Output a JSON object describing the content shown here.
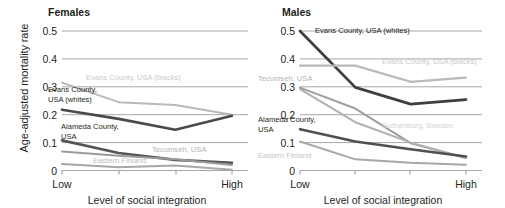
{
  "figure": {
    "ylabel": "Age-adjusted mortality rate",
    "xlabel": "Level of social integration",
    "xtick_low": "Low",
    "xtick_high": "High"
  },
  "panels": [
    {
      "id": "females",
      "title": "Females",
      "labels": [
        {
          "key": "evans_blacks",
          "text": "Evans County, USA (blacks)",
          "x": 86,
          "y": 80,
          "color": "#c9c9c9",
          "anchor": "start",
          "lines": [
            "Evans County, USA (blacks)"
          ]
        },
        {
          "key": "evans_whites",
          "text": "Evans County, USA (whites)",
          "x": 48,
          "y": 92,
          "color": "#231f20",
          "anchor": "start",
          "lines": [
            "Evans County,",
            "USA (whites)"
          ]
        },
        {
          "key": "alameda",
          "text": "Alameda County, USA",
          "x": 61,
          "y": 129,
          "color": "#231f20",
          "anchor": "start",
          "lines": [
            "Alameda County,",
            "USA"
          ]
        },
        {
          "key": "tecumseh",
          "text": "Tecumseh, USA",
          "x": 152,
          "y": 152,
          "color": "#b4b4b4",
          "anchor": "start",
          "lines": [
            "Tecumseh, USA"
          ]
        },
        {
          "key": "eastern_finland",
          "text": "Eastern Finland",
          "x": 93,
          "y": 163,
          "color": "#bdbdbd",
          "anchor": "start",
          "lines": [
            "Eastern Finland"
          ]
        }
      ]
    },
    {
      "id": "males",
      "title": "Males",
      "labels": [
        {
          "key": "evans_whites",
          "text": "Evans County, USA (whites)",
          "x": 315,
          "y": 33,
          "color": "#231f20",
          "anchor": "start",
          "lines": [
            "Evans County, USA (whites)"
          ]
        },
        {
          "key": "evans_blacks",
          "text": "Evans County, USA (blacks)",
          "x": 382,
          "y": 64,
          "color": "#c9c9c9",
          "anchor": "start",
          "lines": [
            "Evans County, USA (blacks)"
          ]
        },
        {
          "key": "tecumseh",
          "text": "Tecumseh, USA",
          "x": 258,
          "y": 81,
          "color": "#b4b4b4",
          "anchor": "start",
          "lines": [
            "Tecumseh, USA"
          ]
        },
        {
          "key": "alameda",
          "text": "Alameda County, USA",
          "x": 258,
          "y": 122,
          "color": "#231f20",
          "anchor": "start",
          "lines": [
            "Alameda County,",
            "USA"
          ]
        },
        {
          "key": "gothenburg",
          "text": "Gothenburg, Sweden",
          "x": 382,
          "y": 128,
          "color": "#d2d2d2",
          "anchor": "start",
          "lines": [
            "Gothenburg, Sweden"
          ]
        },
        {
          "key": "eastern_finland",
          "text": "Eastern Finland",
          "x": 258,
          "y": 158,
          "color": "#c4c4c4",
          "anchor": "start",
          "lines": [
            "Eastern Finland"
          ]
        }
      ]
    }
  ],
  "chart_data": [
    {
      "type": "line",
      "title": "Females",
      "xlabel": "Level of social integration",
      "ylabel": "Age-adjusted mortality rate",
      "x": [
        "Low",
        "2",
        "3",
        "High"
      ],
      "xtick_labels": [
        "Low",
        "",
        "",
        "High"
      ],
      "ylim": [
        0,
        0.5
      ],
      "yticks": [
        0,
        0.1,
        0.2,
        0.3,
        0.4,
        0.5
      ],
      "ytick_labels": [
        "0",
        "0.1",
        "0.2",
        "0.3",
        "0.4",
        "0.5"
      ],
      "grid": true,
      "legend": "inline-annotations",
      "series": [
        {
          "name": "Evans County, USA (blacks)",
          "color": "#b9b9b9",
          "width": 2.0,
          "values": [
            0.315,
            0.245,
            0.235,
            0.2
          ]
        },
        {
          "name": "Evans County, USA (whites)",
          "color": "#4a4a4a",
          "width": 2.6,
          "values": [
            0.218,
            0.185,
            0.146,
            0.196
          ]
        },
        {
          "name": "Alameda County, USA",
          "color": "#555555",
          "width": 2.6,
          "values": [
            0.108,
            0.063,
            0.038,
            0.028
          ]
        },
        {
          "name": "Tecumseh, USA",
          "color": "#9a9a9a",
          "width": 2.0,
          "values": [
            0.068,
            0.053,
            0.04,
            0.02
          ]
        },
        {
          "name": "Eastern Finland",
          "color": "#a8a8a8",
          "width": 2.0,
          "values": [
            0.023,
            0.012,
            0.018,
            0.003
          ]
        }
      ]
    },
    {
      "type": "line",
      "title": "Males",
      "xlabel": "Level of social integration",
      "ylabel": "Age-adjusted mortality rate",
      "x": [
        "Low",
        "2",
        "3",
        "High"
      ],
      "xtick_labels": [
        "Low",
        "",
        "",
        "High"
      ],
      "ylim": [
        0,
        0.5
      ],
      "yticks": [
        0,
        0.1,
        0.2,
        0.3,
        0.4,
        0.5
      ],
      "ytick_labels": [
        "0",
        "0.1",
        "0.2",
        "0.3",
        "0.4",
        "0.5"
      ],
      "grid": true,
      "legend": "inline-annotations",
      "series": [
        {
          "name": "Evans County, USA (whites)",
          "color": "#3f3f3f",
          "width": 2.8,
          "values": [
            0.5,
            0.298,
            0.238,
            0.254
          ]
        },
        {
          "name": "Evans County, USA (blacks)",
          "color": "#b9b9b9",
          "width": 2.2,
          "values": [
            0.376,
            0.376,
            0.318,
            0.333
          ]
        },
        {
          "name": "Tecumseh, USA",
          "color": "#9f9f9f",
          "width": 2.0,
          "values": [
            0.297,
            0.222,
            0.098,
            0.046
          ]
        },
        {
          "name": "Gothenburg, Sweden",
          "color": "#b0b0b0",
          "width": 2.0,
          "values": [
            0.292,
            0.173,
            0.1,
            0.044
          ]
        },
        {
          "name": "Alameda County, USA",
          "color": "#4f4f4f",
          "width": 2.6,
          "values": [
            0.148,
            0.104,
            0.076,
            0.05
          ]
        },
        {
          "name": "Eastern Finland",
          "color": "#a8a8a8",
          "width": 2.0,
          "values": [
            0.104,
            0.04,
            0.028,
            0.021
          ]
        }
      ]
    }
  ]
}
